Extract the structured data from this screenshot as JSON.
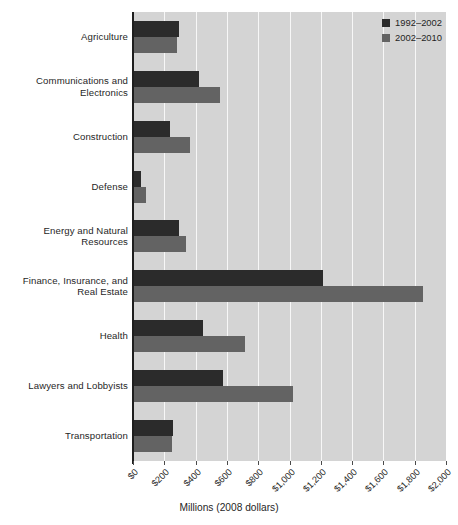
{
  "chart_data": {
    "type": "bar",
    "orientation": "horizontal",
    "title": "",
    "xlabel": "Millions (2008 dollars)",
    "ylabel": "",
    "xlim": [
      0,
      2000
    ],
    "xticks": [
      0,
      200,
      400,
      600,
      800,
      1000,
      1200,
      1400,
      1600,
      1800,
      2000
    ],
    "xtick_labels": [
      "$0",
      "$200",
      "$400",
      "$600",
      "$800",
      "$1,000",
      "$1,200",
      "$1,400",
      "$1,600",
      "$1,800",
      "$2,000"
    ],
    "grid": true,
    "grid_axis": "x",
    "legend_position": "top-right",
    "categories": [
      "Agriculture",
      "Communications and Electronics",
      "Construction",
      "Defense",
      "Energy and Natural Resources",
      "Finance, Insurance, and Real Estate",
      "Health",
      "Lawyers and Lobbyists",
      "Transportation"
    ],
    "category_label_lines": [
      [
        "Agriculture"
      ],
      [
        "Communications and",
        "Electronics"
      ],
      [
        "Construction"
      ],
      [
        "Defense"
      ],
      [
        "Energy and Natural",
        "Resources"
      ],
      [
        "Finance, Insurance, and",
        "Real Estate"
      ],
      [
        "Health"
      ],
      [
        "Lawyers and Lobbyists"
      ],
      [
        "Transportation"
      ]
    ],
    "series": [
      {
        "name": "1992–2002",
        "color": "#2b2b2b",
        "values": [
          295,
          420,
          235,
          50,
          295,
          1215,
          445,
          575,
          255
        ]
      },
      {
        "name": "2002–2010",
        "color": "#636363",
        "values": [
          280,
          555,
          365,
          80,
          340,
          1855,
          715,
          1025,
          250
        ]
      }
    ],
    "plot_background": "#d4d4d4",
    "gridline_color": "#f7f7f7",
    "axis_color": "#1e1e1e"
  },
  "legend": {
    "items": [
      {
        "label": "1992–2002",
        "color": "#2b2b2b"
      },
      {
        "label": "2002–2010",
        "color": "#636363"
      }
    ]
  }
}
